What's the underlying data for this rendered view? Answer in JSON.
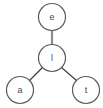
{
  "diagram": {
    "type": "tree-graph",
    "background_color": "#ffffff",
    "width": 103,
    "height": 108,
    "node_radius": 13.5,
    "node_fill": "#ffffff",
    "node_stroke": "#5a5a5a",
    "node_stroke_width": 1.2,
    "label_color": "#4a4a4a",
    "nodes": [
      {
        "id": "n-e",
        "label": "e",
        "cx": 52,
        "cy": 17,
        "role": "root"
      },
      {
        "id": "n-l",
        "label": "l",
        "cx": 52,
        "cy": 58,
        "role": "internal"
      },
      {
        "id": "n-a",
        "label": "a",
        "cx": 20,
        "cy": 90,
        "role": "leaf"
      },
      {
        "id": "n-t",
        "label": "t",
        "cx": 86,
        "cy": 90,
        "role": "leaf"
      }
    ],
    "edges": [
      {
        "id": "edge-e-l",
        "from": "e",
        "to": "l",
        "x1": 52,
        "y1": 31,
        "x2": 52,
        "y2": 44.5,
        "color": "#8c8c8c",
        "width": 2.2
      },
      {
        "id": "edge-l-a",
        "from": "l",
        "to": "a",
        "x1": 42.5,
        "y1": 67.5,
        "x2": 29.5,
        "y2": 80.5,
        "color": "#3f3f3f",
        "width": 1.2
      },
      {
        "id": "edge-l-t",
        "from": "l",
        "to": "t",
        "x1": 61.5,
        "y1": 67.5,
        "x2": 76.5,
        "y2": 80.5,
        "color": "#3f3f3f",
        "width": 1.2
      }
    ]
  }
}
